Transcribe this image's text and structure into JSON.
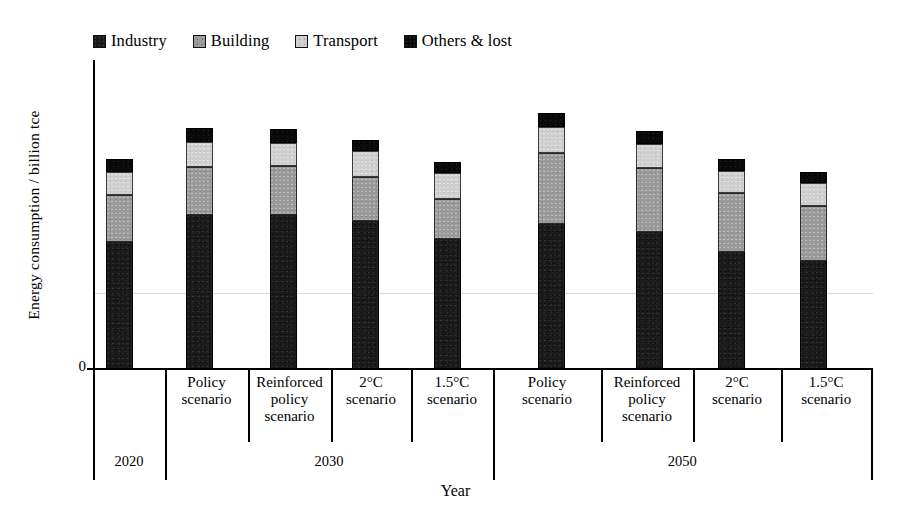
{
  "chart_data": {
    "type": "bar",
    "subtype": "stacked-bar-grouped",
    "title": "",
    "xlabel": "Year",
    "ylabel": "Energy consumption / billion tce",
    "ylim": [
      0,
      8
    ],
    "y_tick_labels": [
      "0"
    ],
    "grid": true,
    "gridlines_y": [
      4
    ],
    "legend_position": "top-left",
    "legend": [
      "Industry",
      "Building",
      "Transport",
      "Others & lost"
    ],
    "group_labels": [
      "2020",
      "2030",
      "2050"
    ],
    "group_spans": [
      1,
      4,
      4
    ],
    "categories": [
      "2020",
      "Policy scenario",
      "Reinforced policy scenario",
      "2°C scenario",
      "1.5°C scenario",
      "Policy scenario",
      "Reinforced policy scenario",
      "2°C scenario",
      "1.5°C scenario"
    ],
    "series": [
      {
        "name": "Industry",
        "values": [
          3.45,
          4.2,
          4.2,
          4.05,
          3.55,
          3.95,
          3.75,
          3.2,
          2.95
        ]
      },
      {
        "name": "Building",
        "values": [
          1.3,
          1.32,
          1.35,
          1.2,
          1.1,
          1.95,
          1.75,
          1.6,
          1.5
        ]
      },
      {
        "name": "Transport",
        "values": [
          0.62,
          0.68,
          0.62,
          0.7,
          0.7,
          0.72,
          0.66,
          0.62,
          0.62
        ]
      },
      {
        "name": "Others & lost",
        "values": [
          0.38,
          0.4,
          0.38,
          0.32,
          0.3,
          0.38,
          0.34,
          0.32,
          0.3
        ]
      }
    ],
    "totals": [
      5.75,
      6.6,
      6.55,
      6.27,
      5.65,
      7.0,
      6.5,
      5.74,
      5.37
    ],
    "colors": {
      "industry": "#1b1b1b",
      "building": "#9a9a9a",
      "transport": "#cfcfcf",
      "others_lost": "#0a0a0a",
      "axis": "#000000",
      "gridline": "#d9d9d9",
      "background": "#ffffff"
    }
  },
  "legend": {
    "items": [
      {
        "label": "Industry",
        "swatch": "#1b1b1b",
        "icon": "legend-swatch-icon"
      },
      {
        "label": "Building",
        "swatch": "#9a9a9a",
        "icon": "legend-swatch-icon"
      },
      {
        "label": "Transport",
        "swatch": "#cfcfcf",
        "icon": "legend-swatch-icon"
      },
      {
        "label": "Others & lost",
        "swatch": "#0a0a0a",
        "icon": "legend-swatch-icon"
      }
    ]
  },
  "axes": {
    "y_title": "Energy consumption / billion tce",
    "y_zero_label": "0",
    "x_title": "Year"
  },
  "category_labels": [
    {
      "line1": "",
      "line2": "",
      "line3": ""
    },
    {
      "line1": "Policy",
      "line2": "scenario",
      "line3": ""
    },
    {
      "line1": "Reinforced",
      "line2": "policy",
      "line3": "scenario"
    },
    {
      "line1": "2°C",
      "line2": "scenario",
      "line3": ""
    },
    {
      "line1": "1.5°C",
      "line2": "scenario",
      "line3": ""
    },
    {
      "line1": "Policy",
      "line2": "scenario",
      "line3": ""
    },
    {
      "line1": "Reinforced",
      "line2": "policy",
      "line3": "scenario"
    },
    {
      "line1": "2°C",
      "line2": "scenario",
      "line3": ""
    },
    {
      "line1": "1.5°C",
      "line2": "scenario",
      "line3": ""
    }
  ],
  "year_labels": [
    "2020",
    "2030",
    "2050"
  ]
}
